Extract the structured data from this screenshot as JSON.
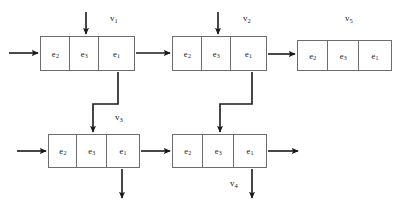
{
  "diagram": {
    "type": "queueing-network",
    "cell_labels": [
      "e₂",
      "e₃",
      "e₁"
    ],
    "stroke_color": "#6d6d6d",
    "arrow_color": "#1a1a1a",
    "background": "#ffffff",
    "nodes": [
      {
        "id": "v1",
        "label": "v",
        "label_sub": "1",
        "x": 40,
        "y": 36,
        "w": 95,
        "h": 35,
        "label_x": 110,
        "label_y": 13,
        "cells": [
          {
            "text": "e",
            "sub": "2",
            "w": 30
          },
          {
            "text": "e",
            "sub": "3",
            "w": 29
          },
          {
            "text": "e",
            "sub": "1",
            "w": 36
          }
        ]
      },
      {
        "id": "v2",
        "label": "v",
        "label_sub": "2",
        "x": 172,
        "y": 36,
        "w": 95,
        "h": 35,
        "label_x": 243,
        "label_y": 13,
        "cells": [
          {
            "text": "e",
            "sub": "2",
            "w": 30
          },
          {
            "text": "e",
            "sub": "3",
            "w": 29
          },
          {
            "text": "e",
            "sub": "1",
            "w": 36
          }
        ]
      },
      {
        "id": "v5",
        "label": "v",
        "label_sub": "5",
        "x": 297,
        "y": 40,
        "w": 95,
        "h": 31,
        "label_x": 345,
        "label_y": 13,
        "cells": [
          {
            "text": "e",
            "sub": "2",
            "w": 31
          },
          {
            "text": "e",
            "sub": "3",
            "w": 31
          },
          {
            "text": "e",
            "sub": "1",
            "w": 33
          }
        ]
      },
      {
        "id": "v3",
        "label": "v",
        "label_sub": "3",
        "x": 48,
        "y": 134,
        "w": 92,
        "h": 34,
        "label_x": 115,
        "label_y": 112,
        "cells": [
          {
            "text": "e",
            "sub": "2",
            "w": 29
          },
          {
            "text": "e",
            "sub": "3",
            "w": 30
          },
          {
            "text": "e",
            "sub": "1",
            "w": 33
          }
        ]
      },
      {
        "id": "v4",
        "label": "v",
        "label_sub": "4",
        "x": 172,
        "y": 134,
        "w": 95,
        "h": 34,
        "label_x": 230,
        "label_y": 178,
        "cells": [
          {
            "text": "e",
            "sub": "2",
            "w": 31
          },
          {
            "text": "e",
            "sub": "3",
            "w": 31
          },
          {
            "text": "e",
            "sub": "1",
            "w": 33
          }
        ]
      }
    ],
    "arrows": [
      {
        "name": "external-arrival-v1",
        "points": [
          [
            9,
            53
          ],
          [
            38,
            53
          ]
        ]
      },
      {
        "name": "external-arrival-top-v1",
        "points": [
          [
            86,
            12
          ],
          [
            86,
            34
          ]
        ]
      },
      {
        "name": "v1-to-v2",
        "points": [
          [
            136,
            53
          ],
          [
            170,
            53
          ]
        ]
      },
      {
        "name": "external-arrival-top-v2",
        "points": [
          [
            218,
            12
          ],
          [
            218,
            34
          ]
        ]
      },
      {
        "name": "v2-to-v5",
        "points": [
          [
            268,
            54
          ],
          [
            295,
            54
          ]
        ]
      },
      {
        "name": "v1-to-v3",
        "points": [
          [
            118,
            72
          ],
          [
            118,
            104
          ],
          [
            93,
            104
          ],
          [
            93,
            132
          ]
        ]
      },
      {
        "name": "v2-to-v4",
        "points": [
          [
            252,
            72
          ],
          [
            252,
            104
          ],
          [
            220,
            104
          ],
          [
            220,
            132
          ]
        ]
      },
      {
        "name": "external-arrival-v3",
        "points": [
          [
            17,
            151
          ],
          [
            46,
            151
          ]
        ]
      },
      {
        "name": "v3-departure-right",
        "points": [
          [
            141,
            151
          ],
          [
            170,
            151
          ]
        ]
      },
      {
        "name": "v3-departure-down",
        "points": [
          [
            122,
            169
          ],
          [
            122,
            198
          ]
        ]
      },
      {
        "name": "v4-departure-right",
        "points": [
          [
            268,
            151
          ],
          [
            298,
            151
          ]
        ]
      },
      {
        "name": "v4-departure-down",
        "points": [
          [
            252,
            169
          ],
          [
            252,
            198
          ]
        ]
      }
    ]
  }
}
